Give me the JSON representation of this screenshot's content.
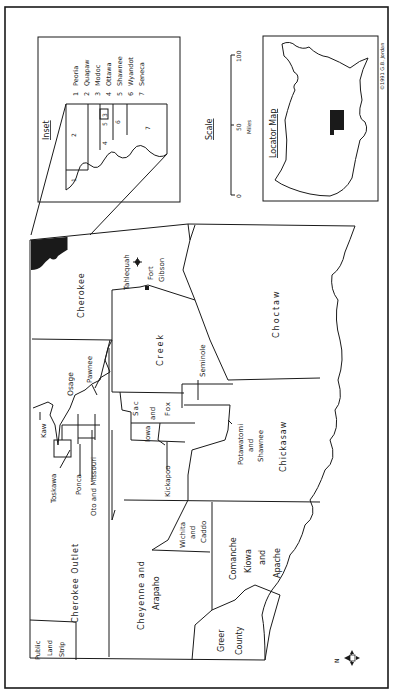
{
  "map": {
    "orientation": "rotated 90° counter-clockwise (north points left)",
    "regions": {
      "public_land_strip": "Public Land Strip",
      "cherokee_outlet": "Cherokee Outlet",
      "cherokee": "Cherokee",
      "creek": "Creek",
      "choctaw": "Choctaw",
      "chickasaw": "Chickasaw",
      "seminole": "Seminole",
      "osage": "Osage",
      "pawnee": "Pawnee",
      "kaw": "Kaw",
      "toskawa": "Toskawa",
      "ponca": "Ponca",
      "oto_missouri": "Oto and Missouri",
      "sac_fox": [
        "Sac",
        "and",
        "Fox"
      ],
      "iowa": "Iowa",
      "kickapoo": "Kickapoo",
      "potawatomi": [
        "Potawatomi",
        "and",
        "Shawnee"
      ],
      "cheyenne_arapaho": [
        "Cheyenne and",
        "Arapaho"
      ],
      "wichita_caddo": [
        "Wichita",
        "and",
        "Caddo"
      ],
      "comanche": [
        "Comanche",
        "Kiowa",
        "and",
        "Apache"
      ],
      "greer": [
        "Greer",
        "County"
      ],
      "public_strip_lines": [
        "Public",
        "Land",
        "Strip"
      ]
    },
    "places": {
      "tahlequah": "Tahlequah",
      "fort_gibson": [
        "Fort",
        "Gibson"
      ]
    },
    "compass": {
      "label": "N"
    }
  },
  "inset": {
    "title": "Inset",
    "region_numbers": [
      "1",
      "2",
      "3",
      "4",
      "5",
      "6",
      "7"
    ],
    "legend": [
      {
        "num": "1",
        "name": "Peoria"
      },
      {
        "num": "2",
        "name": "Quapaw"
      },
      {
        "num": "3",
        "name": "Modoc"
      },
      {
        "num": "4",
        "name": "Ottawa"
      },
      {
        "num": "5",
        "name": "Shawnee"
      },
      {
        "num": "6",
        "name": "Wyandot"
      },
      {
        "num": "7",
        "name": "Seneca"
      }
    ]
  },
  "scale": {
    "title": "Scale",
    "ticks": [
      "0",
      "50",
      "100"
    ],
    "unit": "Miles"
  },
  "locator": {
    "title": "Locator Map"
  },
  "credit": "©1991  G.B. Jordan"
}
